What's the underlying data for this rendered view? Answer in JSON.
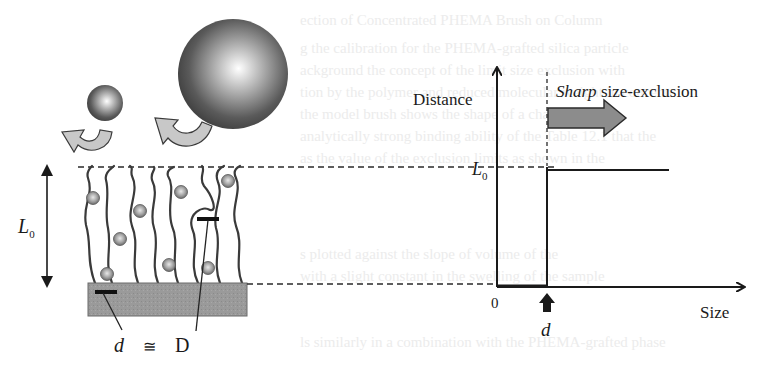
{
  "figure": {
    "type": "diagram"
  },
  "left_panel": {
    "height_label": "L",
    "height_label_sub": "0",
    "equation": {
      "left": "d",
      "operator": "≅",
      "right": "D"
    },
    "particles": [
      {
        "name": "small-particle",
        "description": "small sphere excluded/bounced",
        "size": "small"
      },
      {
        "name": "large-particle",
        "description": "large sphere excluded/bounced",
        "size": "large"
      }
    ],
    "colors": {
      "substrate": "#9a9a9a",
      "chain": "#3a3a3a",
      "sphere_dark": "#4a4a4a",
      "arrow_fill": "#c8c8c8"
    }
  },
  "right_panel": {
    "y_axis_label": "Distance",
    "x_axis_label": "Size",
    "origin_label": "0",
    "level_label": "L",
    "level_label_sub": "0",
    "cutoff_label": "d",
    "annotation_emphasis": "Sharp",
    "annotation_rest": " size-exclusion",
    "colors": {
      "arrow_fill": "#8c8c8c",
      "axis": "#1a1a1a"
    }
  },
  "background_bleed_text": [
    "ection of Concentrated PHEMA Brush on Column",
    "g the calibration for the PHEMA-grafted silica particle",
    "ackground the concept of the limit size exclusion with",
    "tion by the polymer and reduced molecular weight in concentr",
    "the model brush shows the shape of a characteristic",
    "analytically strong binding ability of the Table 12.1 that the",
    "as the value of the exclusion limits as shown in the",
    "s plotted against the slope of volume of the",
    "with a slight constant in the swelling of the sample",
    "ls similarly in a combination with the PHEMA-grafted phase"
  ]
}
